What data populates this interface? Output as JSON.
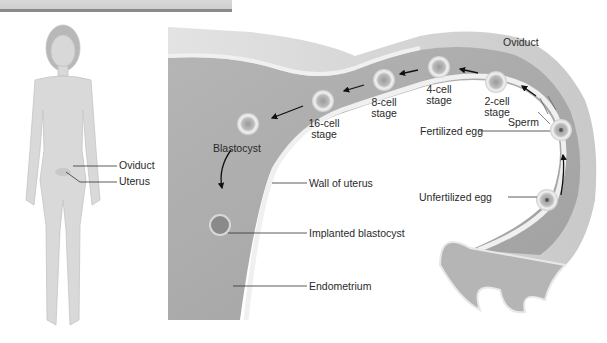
{
  "figure": {
    "body_labels": {
      "oviduct": "Oviduct",
      "uterus": "Uterus"
    },
    "tract_labels": {
      "oviduct": "Oviduct",
      "sperm": "Sperm",
      "fertilized_egg": "Fertilized egg",
      "unfertilized_egg": "Unfertilized egg",
      "two_cell": [
        "2-cell",
        "stage"
      ],
      "four_cell": [
        "4-cell",
        "stage"
      ],
      "eight_cell": [
        "8-cell",
        "stage"
      ],
      "sixteen_cell": [
        "16-cell",
        "stage"
      ],
      "blastocyst": "Blastocyst",
      "wall_of_uterus": "Wall of uterus",
      "implanted_blastocyst": "Implanted blastocyst",
      "endometrium": "Endometrium"
    },
    "colors": {
      "tissue_light": "#d4d4d4",
      "tissue_mid": "#a9a9a9",
      "tissue_dark": "#8f8f8f",
      "lining": "#efefef",
      "label_text": "#2a2a2a",
      "leader_line": "#333333"
    }
  }
}
